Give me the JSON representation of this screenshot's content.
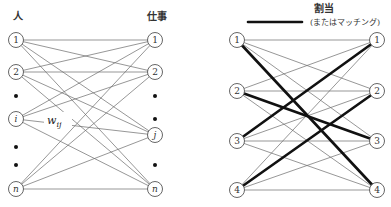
{
  "left_graph": {
    "left_header": "人",
    "right_header": "仕事",
    "left_nodes": [
      {
        "label": "1",
        "y": 40,
        "italic": false
      },
      {
        "label": "2",
        "y": 72,
        "italic": false
      },
      {
        "label": "i",
        "y": 119,
        "italic": true
      },
      {
        "label": "n",
        "y": 189,
        "italic": true
      }
    ],
    "right_nodes": [
      {
        "label": "1",
        "y": 40,
        "italic": false
      },
      {
        "label": "2",
        "y": 72,
        "italic": false
      },
      {
        "label": "j",
        "y": 135,
        "italic": true
      },
      {
        "label": "n",
        "y": 189,
        "italic": true
      }
    ],
    "left_dots_y": [
      96,
      147,
      165
    ],
    "right_dots_y": [
      96,
      119,
      165
    ],
    "edge_label": {
      "main": "w",
      "sub": "ij"
    }
  },
  "right_graph": {
    "legend": {
      "title": "割当",
      "subtitle": "(またはマッチング)"
    },
    "left_nodes": [
      {
        "label": "1",
        "y": 40
      },
      {
        "label": "2",
        "y": 91
      },
      {
        "label": "3",
        "y": 141
      },
      {
        "label": "4",
        "y": 190
      }
    ],
    "right_nodes": [
      {
        "label": "1",
        "y": 40
      },
      {
        "label": "2",
        "y": 91
      },
      {
        "label": "3",
        "y": 141
      },
      {
        "label": "4",
        "y": 190
      }
    ],
    "matching": [
      [
        1,
        4
      ],
      [
        2,
        3
      ],
      [
        3,
        1
      ],
      [
        4,
        2
      ]
    ]
  }
}
